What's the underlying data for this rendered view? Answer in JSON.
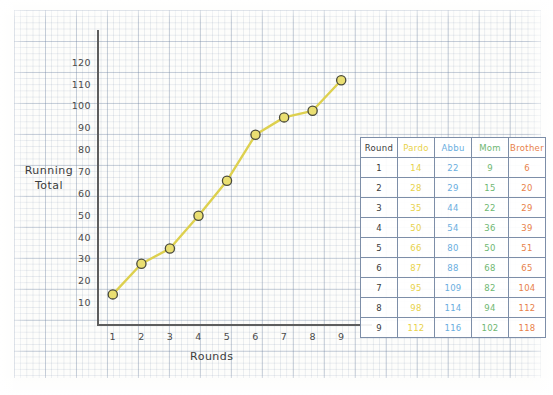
{
  "chart_data": {
    "type": "line",
    "title": "",
    "xlabel": "Rounds",
    "ylabel": "Running Total",
    "x": [
      1,
      2,
      3,
      4,
      5,
      6,
      7,
      8,
      9
    ],
    "xticks": [
      "1",
      "2",
      "3",
      "4",
      "5",
      "6",
      "7",
      "8",
      "9"
    ],
    "yticks": [
      "10",
      "20",
      "30",
      "40",
      "50",
      "60",
      "70",
      "80",
      "90",
      "100",
      "110",
      "120"
    ],
    "ylim": [
      0,
      125
    ],
    "xlim": [
      0.5,
      9.5
    ],
    "grid": true,
    "legend": "none",
    "plotted_series": "Pardo",
    "series": [
      {
        "name": "Pardo",
        "color": "#e8d24a",
        "values": [
          14,
          28,
          35,
          50,
          66,
          87,
          95,
          98,
          112
        ],
        "plotted": true
      },
      {
        "name": "Abbu",
        "color": "#6aaee0",
        "values": [
          22,
          29,
          44,
          54,
          80,
          88,
          109,
          114,
          116
        ],
        "plotted": false
      },
      {
        "name": "Mom",
        "color": "#6fb872",
        "values": [
          9,
          15,
          22,
          36,
          50,
          68,
          82,
          94,
          102
        ],
        "plotted": false
      },
      {
        "name": "Brother",
        "color": "#e8824a",
        "values": [
          6,
          20,
          29,
          39,
          51,
          65,
          104,
          112,
          118
        ],
        "plotted": false
      }
    ]
  },
  "axes": {
    "y_title_line1": "Running",
    "y_title_line2": "Total",
    "x_title": "Rounds"
  },
  "table": {
    "headers": [
      "Round",
      "Pardo",
      "Abbu",
      "Mom",
      "Brother"
    ],
    "rows": [
      [
        "1",
        "14",
        "22",
        "9",
        "6"
      ],
      [
        "2",
        "28",
        "29",
        "15",
        "20"
      ],
      [
        "3",
        "35",
        "44",
        "22",
        "29"
      ],
      [
        "4",
        "50",
        "54",
        "36",
        "39"
      ],
      [
        "5",
        "66",
        "80",
        "50",
        "51"
      ],
      [
        "6",
        "87",
        "88",
        "68",
        "65"
      ],
      [
        "7",
        "95",
        "109",
        "82",
        "104"
      ],
      [
        "8",
        "98",
        "114",
        "94",
        "112"
      ],
      [
        "9",
        "112",
        "116",
        "102",
        "118"
      ]
    ]
  },
  "colors": {
    "pardo": "#e8d24a",
    "abbu": "#6aaee0",
    "mom": "#6fb872",
    "brother": "#e8824a",
    "axis": "#5d5d5d",
    "grid": "#7d8ea8"
  }
}
